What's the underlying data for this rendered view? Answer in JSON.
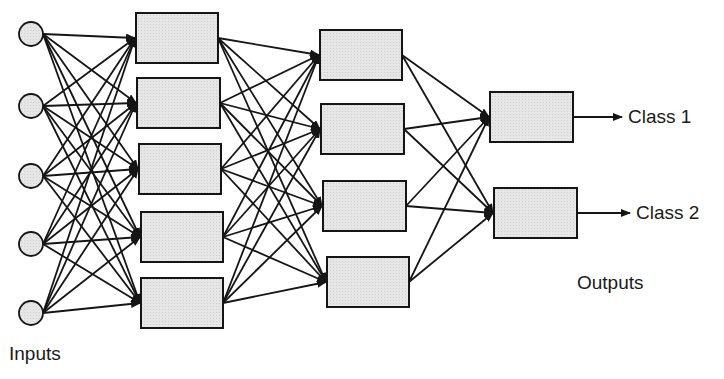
{
  "diagram": {
    "colors": {
      "stroke": "#151515",
      "node_fill": "#e4e4e4",
      "background": "#ffffff"
    },
    "layers": [
      {
        "name": "input",
        "type": "circle",
        "count": 5,
        "nodes": [
          {
            "cx": 31,
            "cy": 34
          },
          {
            "cx": 31,
            "cy": 106
          },
          {
            "cx": 31,
            "cy": 176
          },
          {
            "cx": 31,
            "cy": 244
          },
          {
            "cx": 31,
            "cy": 313
          }
        ],
        "r": 12
      },
      {
        "name": "hidden1",
        "type": "box",
        "count": 5,
        "nodes": [
          {
            "x": 136,
            "y": 13,
            "w": 82,
            "h": 50
          },
          {
            "x": 137,
            "y": 78,
            "w": 83,
            "h": 50
          },
          {
            "x": 139,
            "y": 144,
            "w": 82,
            "h": 50
          },
          {
            "x": 141,
            "y": 212,
            "w": 82,
            "h": 50
          },
          {
            "x": 141,
            "y": 278,
            "w": 82,
            "h": 50
          }
        ]
      },
      {
        "name": "hidden2",
        "type": "box",
        "count": 4,
        "nodes": [
          {
            "x": 320,
            "y": 30,
            "w": 82,
            "h": 50
          },
          {
            "x": 321,
            "y": 104,
            "w": 83,
            "h": 50
          },
          {
            "x": 323,
            "y": 181,
            "w": 83,
            "h": 50
          },
          {
            "x": 327,
            "y": 257,
            "w": 82,
            "h": 50
          }
        ]
      },
      {
        "name": "output",
        "type": "box",
        "count": 2,
        "nodes": [
          {
            "x": 490,
            "y": 92,
            "w": 83,
            "h": 50
          },
          {
            "x": 494,
            "y": 188,
            "w": 83,
            "h": 50
          }
        ]
      }
    ],
    "connections": "fully-connected between consecutive layers, arrowheads at target",
    "labels": {
      "inputs": "Inputs",
      "outputs": "Outputs",
      "class1": "Class 1",
      "class2": "Class 2"
    }
  }
}
